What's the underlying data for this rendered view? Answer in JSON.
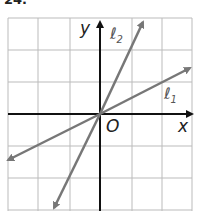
{
  "header": {
    "number": "24."
  },
  "axes": {
    "x_label": "x",
    "y_label": "y",
    "origin_label": "O"
  },
  "lines": [
    {
      "name": "ℓ1",
      "label": "ℓ",
      "subscript": "1",
      "slope": 0.5
    },
    {
      "name": "ℓ2",
      "label": "ℓ",
      "subscript": "2",
      "slope": 2
    }
  ],
  "grid": {
    "columns": 6,
    "rows": 6,
    "color": "#bbbbbb"
  },
  "colors": {
    "axis": "#111111",
    "line": "#777777"
  }
}
